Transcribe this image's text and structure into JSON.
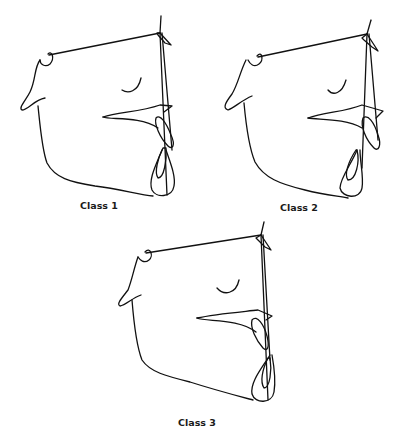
{
  "figure": {
    "panels": [
      {
        "id": "class1",
        "label": "Class 1"
      },
      {
        "id": "class2",
        "label": "Class 2"
      },
      {
        "id": "class3",
        "label": "Class 3"
      }
    ],
    "line_color": "#111111",
    "background": "#ffffff"
  }
}
